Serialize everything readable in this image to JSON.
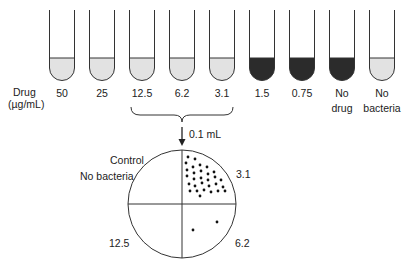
{
  "figure": {
    "row_label": {
      "line1": "Drug",
      "line2": "(µg/mL)"
    },
    "tubes": [
      {
        "label1": "50",
        "label2": "",
        "state": "clear",
        "cx": 62
      },
      {
        "label1": "25",
        "label2": "",
        "state": "clear",
        "cx": 102
      },
      {
        "label1": "12.5",
        "label2": "",
        "state": "clear",
        "cx": 142
      },
      {
        "label1": "6.2",
        "label2": "",
        "state": "clear",
        "cx": 182
      },
      {
        "label1": "3.1",
        "label2": "",
        "state": "clear",
        "cx": 222
      },
      {
        "label1": "1.5",
        "label2": "",
        "state": "turbid",
        "cx": 262
      },
      {
        "label1": "0.75",
        "label2": "",
        "state": "turbid",
        "cx": 302
      },
      {
        "label1": "No",
        "label2": "drug",
        "state": "turbid",
        "cx": 342
      },
      {
        "label1": "No",
        "label2": "bacteria",
        "state": "clear",
        "cx": 382
      }
    ],
    "colors": {
      "clear_fill": "#e2e2e2",
      "turbid_fill": "#2b2b2b",
      "stroke": "#333333"
    },
    "transfer_label": "0.1 mL",
    "plate": {
      "quadrants": [
        {
          "position": "top-left",
          "label1": "Control",
          "label2": "No bacteria",
          "colonies": 0
        },
        {
          "position": "top-right",
          "label1": "3.1",
          "label2": "",
          "colonies": 30
        },
        {
          "position": "bottom-right",
          "label1": "6.2",
          "label2": "",
          "colonies": 2
        },
        {
          "position": "bottom-left",
          "label1": "12.5",
          "label2": "",
          "colonies": 0
        }
      ]
    }
  }
}
